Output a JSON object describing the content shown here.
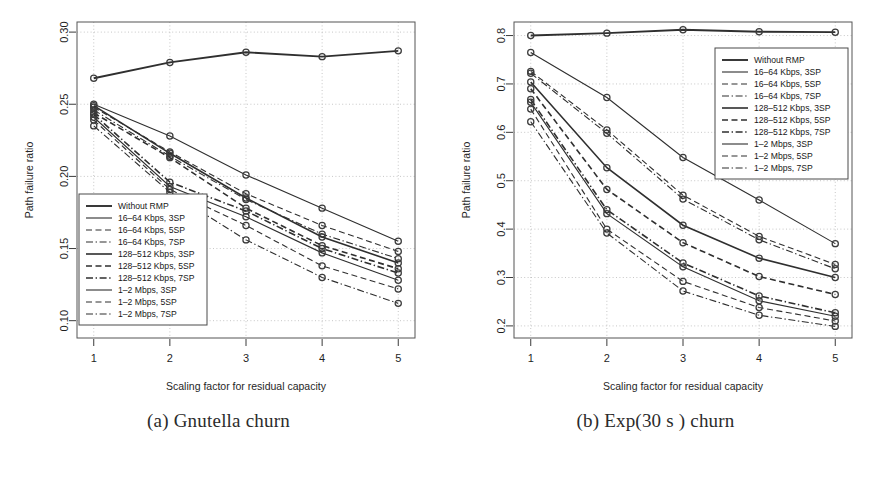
{
  "figure": {
    "panel_a_caption": "(a) Gnutella churn",
    "panel_b_caption": "(b) Exp(30 s ) churn"
  },
  "legend_entries": [
    {
      "label": "Without RMP",
      "style": "solid",
      "width": 1.9
    },
    {
      "label": "16–64 Kbps, 3SP",
      "style": "solid",
      "width": 1.1
    },
    {
      "label": "16–64 Kbps, 5SP",
      "style": "dashed",
      "width": 1.1
    },
    {
      "label": "16–64 Kbps, 7SP",
      "style": "dashdot",
      "width": 1.1
    },
    {
      "label": "128–512 Kbps, 3SP",
      "style": "solid",
      "width": 1.6
    },
    {
      "label": "128–512 Kbps, 5SP",
      "style": "dashed",
      "width": 1.6
    },
    {
      "label": "128–512 Kbps, 7SP",
      "style": "dashdot",
      "width": 1.6
    },
    {
      "label": "1–2 Mbps, 3SP",
      "style": "solid",
      "width": 1.1
    },
    {
      "label": "1–2 Mbps, 5SP",
      "style": "dashed",
      "width": 1.1
    },
    {
      "label": "1–2 Mbps, 7SP",
      "style": "dashdot",
      "width": 1.1
    }
  ],
  "chart_data": [
    {
      "id": "panel-a",
      "type": "line",
      "title": "(a) Gnutella churn",
      "xlabel": "Scaling factor for residual capacity",
      "ylabel": "Path failure ratio",
      "x": [
        1,
        2,
        3,
        4,
        5
      ],
      "xlim": [
        0.78,
        5.22
      ],
      "ylim": [
        0.088,
        0.307
      ],
      "xticks": [
        1,
        2,
        3,
        4,
        5
      ],
      "xticklabels": [
        "1",
        "2",
        "3",
        "4",
        "5"
      ],
      "yticks": [
        0.1,
        0.15,
        0.2,
        0.25,
        0.3
      ],
      "yticklabels": [
        "0.10",
        "0.15",
        "0.20",
        "0.25",
        "0.30"
      ],
      "grid": true,
      "legend_position": "bottom-left",
      "series": [
        {
          "name": "Without RMP",
          "values": [
            0.268,
            0.279,
            0.286,
            0.283,
            0.287
          ]
        },
        {
          "name": "16-64 Kbps, 3SP",
          "values": [
            0.25,
            0.228,
            0.201,
            0.178,
            0.155
          ]
        },
        {
          "name": "16-64 Kbps, 5SP",
          "values": [
            0.248,
            0.217,
            0.188,
            0.166,
            0.148
          ]
        },
        {
          "name": "16-64 Kbps, 7SP",
          "values": [
            0.246,
            0.214,
            0.184,
            0.16,
            0.143
          ]
        },
        {
          "name": "128-512 Kbps, 3SP",
          "values": [
            0.249,
            0.216,
            0.185,
            0.158,
            0.14
          ]
        },
        {
          "name": "128-512 Kbps, 5SP",
          "values": [
            0.244,
            0.213,
            0.178,
            0.152,
            0.136
          ]
        },
        {
          "name": "128-512 Kbps, 7SP",
          "values": [
            0.243,
            0.196,
            0.176,
            0.15,
            0.133
          ]
        },
        {
          "name": "1-2 Mbps, 3SP",
          "values": [
            0.241,
            0.193,
            0.172,
            0.147,
            0.128
          ]
        },
        {
          "name": "1-2 Mbps, 5SP",
          "values": [
            0.239,
            0.191,
            0.166,
            0.138,
            0.122
          ]
        },
        {
          "name": "1-2 Mbps, 7SP",
          "values": [
            0.235,
            0.189,
            0.156,
            0.13,
            0.112
          ]
        }
      ]
    },
    {
      "id": "panel-b",
      "type": "line",
      "title": "(b) Exp(30 s ) churn",
      "xlabel": "Scaling factor for residual capacity",
      "ylabel": "Path failure ratio",
      "x": [
        1,
        2,
        3,
        4,
        5
      ],
      "xlim": [
        0.78,
        5.22
      ],
      "ylim": [
        0.175,
        0.828
      ],
      "xticks": [
        1,
        2,
        3,
        4,
        5
      ],
      "xticklabels": [
        "1",
        "2",
        "3",
        "4",
        "5"
      ],
      "yticks": [
        0.2,
        0.3,
        0.4,
        0.5,
        0.6,
        0.7,
        0.8
      ],
      "yticklabels": [
        "0.2",
        "0.3",
        "0.4",
        "0.5",
        "0.6",
        "0.7",
        "0.8"
      ],
      "grid": true,
      "legend_position": "top-right",
      "series": [
        {
          "name": "Without RMP",
          "values": [
            0.8,
            0.805,
            0.812,
            0.808,
            0.807
          ]
        },
        {
          "name": "16-64 Kbps, 3SP",
          "values": [
            0.765,
            0.672,
            0.548,
            0.46,
            0.37
          ]
        },
        {
          "name": "16-64 Kbps, 5SP",
          "values": [
            0.726,
            0.605,
            0.47,
            0.385,
            0.327
          ]
        },
        {
          "name": "16-64 Kbps, 7SP",
          "values": [
            0.722,
            0.598,
            0.462,
            0.378,
            0.318
          ]
        },
        {
          "name": "128-512 Kbps, 3SP",
          "values": [
            0.704,
            0.527,
            0.408,
            0.34,
            0.3
          ]
        },
        {
          "name": "128-512 Kbps, 5SP",
          "values": [
            0.69,
            0.482,
            0.372,
            0.302,
            0.265
          ]
        },
        {
          "name": "128-512 Kbps, 7SP",
          "values": [
            0.668,
            0.44,
            0.33,
            0.262,
            0.227
          ]
        },
        {
          "name": "1-2 Mbps, 3SP",
          "values": [
            0.662,
            0.432,
            0.322,
            0.252,
            0.22
          ]
        },
        {
          "name": "1-2 Mbps, 5SP",
          "values": [
            0.648,
            0.4,
            0.292,
            0.238,
            0.21
          ]
        },
        {
          "name": "1-2 Mbps, 7SP",
          "values": [
            0.622,
            0.392,
            0.272,
            0.222,
            0.199
          ]
        }
      ]
    }
  ]
}
